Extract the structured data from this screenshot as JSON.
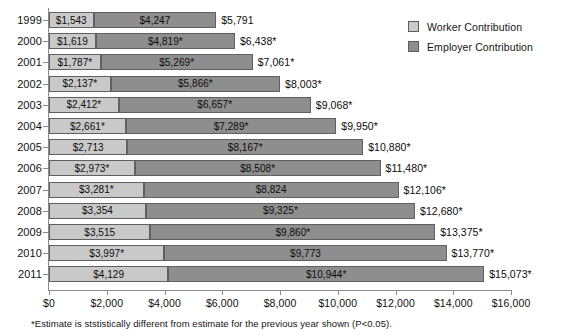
{
  "chart_data": {
    "type": "bar",
    "subtype": "horizontal-stacked",
    "title": "",
    "xlabel": "",
    "ylabel": "",
    "xlim": [
      0,
      16000
    ],
    "xticks": [
      0,
      2000,
      4000,
      6000,
      8000,
      10000,
      12000,
      14000,
      16000
    ],
    "xtick_labels": [
      "$0",
      "$2,000",
      "$4,000",
      "$6,000",
      "$8,000",
      "$10,000",
      "$12,000",
      "$14,000",
      "$16,000"
    ],
    "grid": false,
    "legend_position": "top-right",
    "categories": [
      "1999",
      "2000",
      "2001",
      "2002",
      "2003",
      "2004",
      "2005",
      "2006",
      "2007",
      "2008",
      "2009",
      "2010",
      "2011"
    ],
    "series": [
      {
        "name": "Worker Contribution",
        "color": "#c9c9c9",
        "values": [
          1543,
          1619,
          1787,
          2137,
          2412,
          2661,
          2713,
          2973,
          3281,
          3354,
          3515,
          3997,
          4129
        ],
        "labels": [
          "$1,543",
          "$1,619",
          "$1,787*",
          "$2,137*",
          "$2,412*",
          "$2,661*",
          "$2,713",
          "$2,973*",
          "$3,281*",
          "$3,354",
          "$3,515",
          "$3,997*",
          "$4,129"
        ]
      },
      {
        "name": "Employer Contribution",
        "color": "#8e8e8e",
        "values": [
          4247,
          4819,
          5269,
          5866,
          6657,
          7289,
          8167,
          8508,
          8824,
          9325,
          9860,
          9773,
          10944
        ],
        "labels": [
          "$4,247",
          "$4,819*",
          "$5,269*",
          "$5,866*",
          "$6,657*",
          "$7,289*",
          "$8,167*",
          "$8,508*",
          "$8,824",
          "$9,325*",
          "$9,860*",
          "$9,773",
          "$10,944*"
        ]
      }
    ],
    "totals": [
      5791,
      6438,
      7061,
      8003,
      9068,
      9950,
      10880,
      11480,
      12106,
      12680,
      13375,
      13770,
      15073
    ],
    "total_labels": [
      "$5,791",
      "$6,438*",
      "$7,061*",
      "$8,003*",
      "$9,068*",
      "$9,950*",
      "$10,880*",
      "$11,480*",
      "$12,106*",
      "$12,680*",
      "$13,375*",
      "$13,770*",
      "$15,073*"
    ],
    "annotations": [
      "*Estimate is ststistically different from estimate for the previous year shown (P<0.05)."
    ]
  },
  "legend": {
    "items": [
      {
        "label": "Worker Contribution",
        "color": "#c9c9c9"
      },
      {
        "label": "Employer Contribution",
        "color": "#8e8e8e"
      }
    ]
  },
  "footnote": "*Estimate is ststistically different from estimate for the previous year shown (P<0.05)."
}
